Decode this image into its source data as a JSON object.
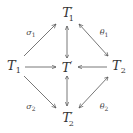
{
  "diagram": {
    "type": "commutative-diagram",
    "nodes": {
      "T1p": {
        "base": "T",
        "sub": "1",
        "prime": "′"
      },
      "T1": {
        "base": "T",
        "sub": "1",
        "prime": ""
      },
      "Tp": {
        "base": "T",
        "sub": "",
        "prime": "′"
      },
      "T2": {
        "base": "T",
        "sub": "2",
        "prime": ""
      },
      "T2p": {
        "base": "T",
        "sub": "2",
        "prime": "′"
      }
    },
    "labels": {
      "sigma1": {
        "sym": "σ",
        "sub": "1"
      },
      "sigma2": {
        "sym": "σ",
        "sub": "2"
      },
      "theta1": {
        "sym": "θ",
        "sub": "1"
      },
      "theta2": {
        "sym": "θ",
        "sub": "2"
      }
    },
    "edges": [
      {
        "from": "T1",
        "to": "T1′",
        "label": "σ1"
      },
      {
        "from": "T1",
        "to": "T′",
        "label": ""
      },
      {
        "from": "T1",
        "to": "T2′",
        "label": "σ2"
      },
      {
        "from": "T2",
        "to": "T1′",
        "label": "θ1"
      },
      {
        "from": "T2",
        "to": "T′",
        "label": ""
      },
      {
        "from": "T2",
        "to": "T2′",
        "label": "θ2"
      },
      {
        "from": "T′",
        "to": "T1′",
        "label": ""
      },
      {
        "from": "T′",
        "to": "T2′",
        "label": ""
      }
    ],
    "line_color": "#555555"
  }
}
